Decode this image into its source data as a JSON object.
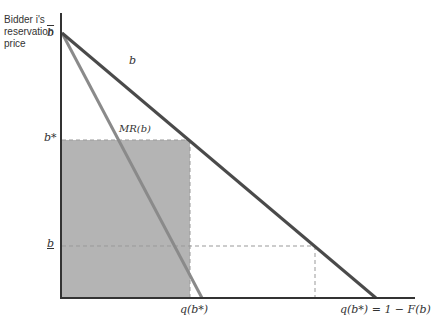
{
  "diagram": {
    "y_axis_label_lines": [
      "Bidder i's",
      "reservation",
      "price"
    ],
    "y_ticks": {
      "b_upper": "b",
      "b_star": "b*",
      "b_lower": "b"
    },
    "curves": {
      "demand": "b",
      "marginal_revenue": "MR(b)"
    },
    "x_ticks": {
      "q_b_star": "q(b*)",
      "q_equation": "q(b*) = 1 − F(b)"
    },
    "colors": {
      "axis": "#333333",
      "demand_line": "#4a4a4a",
      "mr_line": "#8a8a8a",
      "shaded_area": "#b4b4b4",
      "dashed": "#999999"
    }
  }
}
